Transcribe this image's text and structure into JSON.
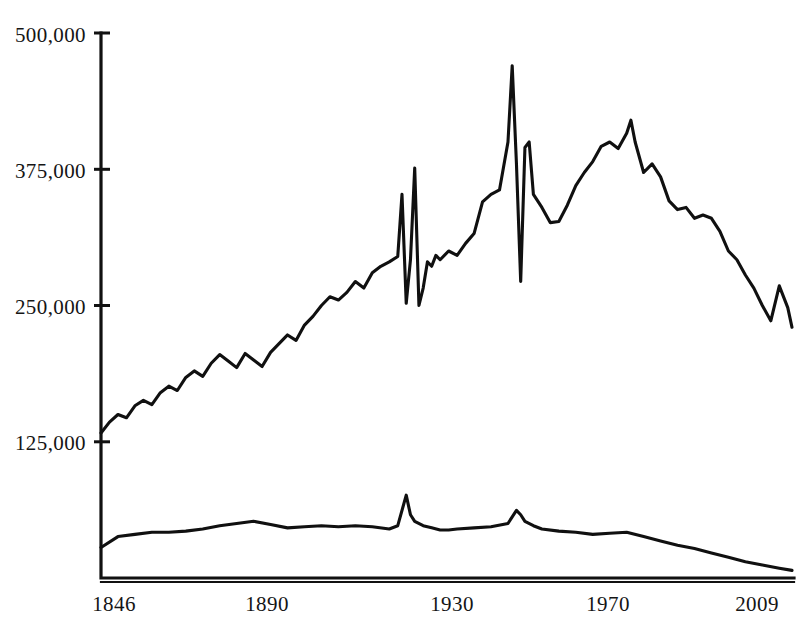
{
  "chart_data": {
    "type": "line",
    "title": "",
    "subtitle": "",
    "xlabel": "",
    "ylabel": "",
    "grid": false,
    "legend_position": "none",
    "xlim": [
      1846,
      2009
    ],
    "ylim": [
      0,
      500000
    ],
    "x_tick_labels": [
      "1846",
      "1890",
      "1930",
      "1970",
      "2009"
    ],
    "x_tick_values": [
      1846,
      1890,
      1930,
      1970,
      2009
    ],
    "y_tick_labels": [
      "500,000",
      "375,000",
      "250,000",
      "125,000"
    ],
    "y_tick_values": [
      500000,
      375000,
      250000,
      125000
    ],
    "annotations": [],
    "series": [
      {
        "name": "upper-series",
        "x": [
          1846,
          1848,
          1850,
          1852,
          1854,
          1856,
          1858,
          1860,
          1862,
          1864,
          1866,
          1868,
          1870,
          1872,
          1874,
          1876,
          1878,
          1880,
          1882,
          1884,
          1886,
          1888,
          1890,
          1892,
          1894,
          1896,
          1898,
          1900,
          1902,
          1904,
          1906,
          1908,
          1910,
          1912,
          1914,
          1916,
          1917,
          1918,
          1919,
          1920,
          1921,
          1922,
          1923,
          1924,
          1925,
          1926,
          1928,
          1930,
          1932,
          1934,
          1936,
          1938,
          1940,
          1942,
          1943,
          1944,
          1945,
          1946,
          1947,
          1948,
          1950,
          1952,
          1954,
          1956,
          1958,
          1960,
          1962,
          1964,
          1966,
          1968,
          1970,
          1971,
          1972,
          1974,
          1976,
          1978,
          1980,
          1982,
          1984,
          1986,
          1988,
          1990,
          1992,
          1994,
          1996,
          1998,
          2000,
          2002,
          2004,
          2006,
          2008,
          2009
        ],
        "values": [
          133000,
          143000,
          150000,
          147000,
          158000,
          163000,
          159000,
          170000,
          176000,
          172000,
          184000,
          190000,
          185000,
          197000,
          205000,
          199000,
          193000,
          206000,
          200000,
          194000,
          207000,
          215000,
          223000,
          218000,
          232000,
          240000,
          250000,
          258000,
          255000,
          262000,
          272000,
          266000,
          280000,
          286000,
          290000,
          295000,
          352000,
          252000,
          292000,
          376000,
          250000,
          266000,
          290000,
          286000,
          296000,
          292000,
          300000,
          296000,
          307000,
          316000,
          345000,
          352000,
          356000,
          400000,
          470000,
          380000,
          272000,
          395000,
          400000,
          352000,
          340000,
          326000,
          327000,
          342000,
          360000,
          372000,
          382000,
          396000,
          400000,
          394000,
          408000,
          420000,
          400000,
          372000,
          380000,
          368000,
          346000,
          338000,
          340000,
          330000,
          333000,
          330000,
          318000,
          300000,
          292000,
          278000,
          266000,
          250000,
          236000,
          268000,
          248000,
          230000
        ]
      },
      {
        "name": "lower-series",
        "x": [
          1846,
          1850,
          1854,
          1858,
          1862,
          1866,
          1870,
          1874,
          1878,
          1882,
          1886,
          1890,
          1894,
          1898,
          1902,
          1906,
          1910,
          1914,
          1916,
          1918,
          1919,
          1920,
          1922,
          1924,
          1926,
          1928,
          1930,
          1934,
          1938,
          1942,
          1944,
          1945,
          1946,
          1948,
          1950,
          1954,
          1958,
          1962,
          1966,
          1970,
          1974,
          1978,
          1982,
          1986,
          1990,
          1994,
          1998,
          2002,
          2006,
          2009
        ],
        "values": [
          28000,
          38000,
          40000,
          42000,
          42000,
          43000,
          45000,
          48000,
          50000,
          52000,
          49000,
          46000,
          47000,
          48000,
          47000,
          48000,
          47000,
          45000,
          48000,
          76000,
          58000,
          52000,
          48000,
          46000,
          44000,
          44000,
          45000,
          46000,
          47000,
          50000,
          62000,
          58000,
          52000,
          48000,
          45000,
          43000,
          42000,
          40000,
          41000,
          42000,
          38000,
          34000,
          30000,
          27000,
          23000,
          19000,
          15000,
          12000,
          9000,
          7000
        ]
      }
    ]
  },
  "axes": {
    "y_axis_name": "y-axis",
    "x_axis_name": "x-axis"
  }
}
